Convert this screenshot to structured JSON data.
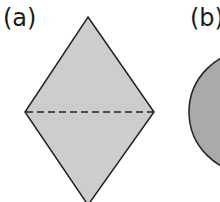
{
  "figures": [
    {
      "label": "(a)",
      "shape": "rhombus",
      "fill": "#cdcdcd",
      "fold_line": "dashed horizontal diagonal"
    },
    {
      "label": "(b)",
      "shape": "circle",
      "fill": "#a9a9a9"
    }
  ],
  "colors": {
    "outline": "#222222",
    "rhombus_fill": "#cdcdcd",
    "circle_fill": "#a9a9a9"
  }
}
